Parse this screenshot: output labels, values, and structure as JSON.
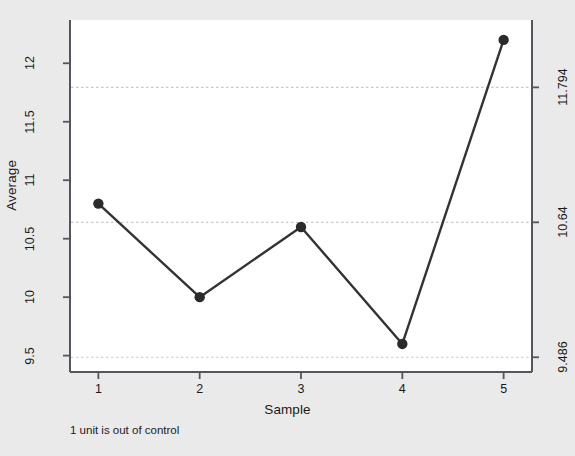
{
  "chart_data": {
    "type": "line",
    "title": "",
    "xlabel": "Sample",
    "ylabel": "Average",
    "x": [
      1,
      2,
      3,
      4,
      5
    ],
    "values": [
      10.8,
      10.0,
      10.6,
      9.6,
      12.2
    ],
    "categories": [
      "1",
      "2",
      "3",
      "4",
      "5"
    ],
    "xlim": [
      0.72,
      5.28
    ],
    "ylim": [
      9.36,
      12.37
    ],
    "grid": false,
    "legend": null,
    "series": [
      {
        "name": "Average",
        "values": [
          10.8,
          10.0,
          10.6,
          9.6,
          12.2
        ]
      }
    ],
    "x_tick_labels": [
      "1",
      "2",
      "3",
      "4",
      "5"
    ],
    "y_tick_labels_left": [
      "9.5",
      "10",
      "10.5",
      "11",
      "11.5",
      "12"
    ],
    "y_tick_values_left": [
      9.5,
      10,
      10.5,
      11,
      11.5,
      12
    ],
    "y_tick_labels_right": [
      "9.486",
      "10.64",
      "11.794"
    ],
    "y_tick_values_right": [
      9.486,
      10.64,
      11.794
    ],
    "control_limits": {
      "lower_label": "9.486",
      "center_label": "10.64",
      "upper_label": "11.794",
      "lower": 9.486,
      "center": 10.64,
      "upper": 11.794
    },
    "annotations": [
      {
        "text": "1 unit is out of control",
        "position": "below-axis-left"
      }
    ],
    "colors": {
      "background": "#eaeaea",
      "plot_area": "#ffffff",
      "line": "#333333",
      "marker": "#2b2b2b",
      "limit_line": "#c8c8d2",
      "axis": "#4a4a55",
      "text": "#1a1a1a"
    }
  },
  "caption": {
    "note": "1 unit is out of control"
  },
  "axes": {
    "y_title": "Average",
    "x_title": "Sample"
  }
}
